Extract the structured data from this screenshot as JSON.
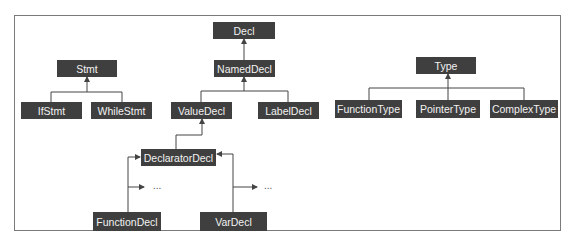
{
  "diagram": {
    "nodes": {
      "decl": "Decl",
      "named_decl": "NamedDecl",
      "stmt": "Stmt",
      "if_stmt": "IfStmt",
      "while_stmt": "WhileStmt",
      "value_decl": "ValueDecl",
      "label_decl": "LabelDecl",
      "type": "Type",
      "function_type": "FunctionType",
      "pointer_type": "PointerType",
      "complex_type": "ComplexType",
      "declarator_decl": "DeclaratorDecl",
      "function_decl": "FunctionDecl",
      "var_decl": "VarDecl"
    },
    "ellipsis_left": "...",
    "ellipsis_right": "...",
    "colors": {
      "node_fill": "#3f3f3f",
      "node_text": "#f2f2f2",
      "edge": "#444444",
      "frame": "#7a7a7a"
    }
  }
}
